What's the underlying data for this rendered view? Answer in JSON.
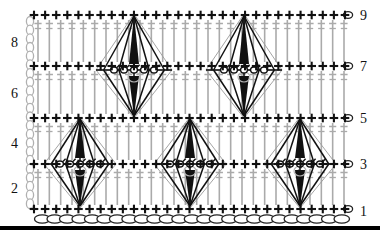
{
  "diagram": {
    "kind": "crochet-stitch-chart",
    "title": "",
    "width": 380,
    "height": 231,
    "background": "#ffffff",
    "colors": {
      "stitch_dark": "#111111",
      "stitch_gray": "#aaaaaa",
      "chain_outline": "#222222",
      "chain_gray": "#b0b0b0",
      "baseline": "#000000"
    },
    "row_labels_left": [
      {
        "text": "8",
        "x": 16,
        "y": 44
      },
      {
        "text": "6",
        "x": 16,
        "y": 95
      },
      {
        "text": "4",
        "x": 16,
        "y": 145
      },
      {
        "text": "2",
        "x": 16,
        "y": 190
      }
    ],
    "row_labels_right": [
      {
        "text": "9",
        "x": 360,
        "y": 17
      },
      {
        "text": "7",
        "x": 360,
        "y": 68
      },
      {
        "text": "5",
        "x": 360,
        "y": 120
      },
      {
        "text": "3",
        "x": 360,
        "y": 166
      },
      {
        "text": "1",
        "x": 360,
        "y": 213
      }
    ],
    "sc_rows": [
      {
        "label": "9",
        "y": 15,
        "x_start": 34,
        "x_end": 345,
        "count": 29
      },
      {
        "label": "7",
        "y": 66,
        "x_start": 34,
        "x_end": 345,
        "count": 29
      },
      {
        "label": "5",
        "y": 118,
        "x_start": 34,
        "x_end": 345,
        "count": 29
      },
      {
        "label": "3",
        "y": 164,
        "x_start": 34,
        "x_end": 345,
        "count": 29
      },
      {
        "label": "1",
        "y": 209,
        "x_start": 34,
        "x_end": 345,
        "count": 29
      }
    ],
    "dc_bands": [
      {
        "between_rows": "7-9",
        "y_top": 18,
        "y_bottom": 64,
        "x_start": 38,
        "x_end": 344,
        "count": 28
      },
      {
        "between_rows": "5-7",
        "y_top": 69,
        "y_bottom": 116,
        "x_start": 38,
        "x_end": 344,
        "count": 28
      },
      {
        "between_rows": "3-5",
        "y_top": 121,
        "y_bottom": 162,
        "x_start": 38,
        "x_end": 344,
        "count": 28
      },
      {
        "between_rows": "1-3",
        "y_top": 167,
        "y_bottom": 207,
        "x_start": 38,
        "x_end": 344,
        "count": 28
      }
    ],
    "motifs": [
      {
        "id": "motif-upper-1",
        "center_x": 134,
        "top_y": 14,
        "mid_y": 70,
        "bottom_y": 118,
        "half_width": 38,
        "spokes": 5
      },
      {
        "id": "motif-upper-2",
        "center_x": 244,
        "top_y": 14,
        "mid_y": 70,
        "bottom_y": 118,
        "half_width": 38,
        "spokes": 5
      },
      {
        "id": "motif-lower-1",
        "center_x": 80,
        "top_y": 117,
        "mid_y": 164,
        "bottom_y": 208,
        "half_width": 36,
        "spokes": 5
      },
      {
        "id": "motif-lower-2",
        "center_x": 190,
        "top_y": 117,
        "mid_y": 164,
        "bottom_y": 208,
        "half_width": 36,
        "spokes": 5
      },
      {
        "id": "motif-lower-3",
        "center_x": 300,
        "top_y": 117,
        "mid_y": 164,
        "bottom_y": 208,
        "half_width": 36,
        "spokes": 5
      }
    ],
    "turning_chains": [
      {
        "id": "turning-chain-col",
        "x": 30,
        "y_top": 17,
        "y_bottom": 208,
        "links": 22
      }
    ],
    "edge_chains_right": [
      {
        "x": 348,
        "y": 15
      },
      {
        "x": 348,
        "y": 66
      },
      {
        "x": 348,
        "y": 118
      },
      {
        "x": 348,
        "y": 164
      },
      {
        "x": 348,
        "y": 209
      }
    ],
    "foundation_chain": {
      "y": 219,
      "x_start": 36,
      "x_end": 348,
      "links": 25
    },
    "baseline": {
      "y": 228,
      "x_start": 0,
      "x_end": 380,
      "thickness": 4
    }
  }
}
